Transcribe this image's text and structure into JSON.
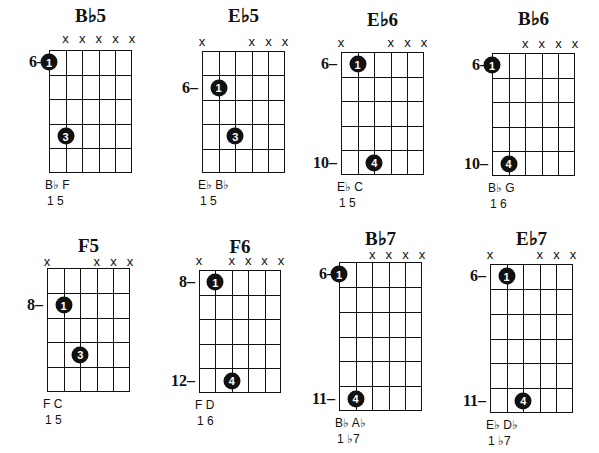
{
  "chords": [
    {
      "name": "B♭5",
      "muted_label": "x",
      "fret_labels": [
        {
          "text": "6–",
          "row": 0.5
        }
      ],
      "notes": "B♭ F",
      "degrees": "1  5",
      "rows": 5,
      "muted": [
        1,
        2,
        3,
        4,
        5
      ],
      "dots": [
        {
          "string": 0,
          "row": 0.5,
          "finger": "1"
        },
        {
          "string": 1,
          "row": 3.5,
          "finger": "3"
        }
      ]
    },
    {
      "name": "E♭5",
      "muted_label": "x",
      "fret_labels": [
        {
          "text": "6–",
          "row": 1.5
        }
      ],
      "notes": "E♭ B♭",
      "degrees": "1  5",
      "rows": 5,
      "muted": [
        0,
        3,
        4,
        5
      ],
      "dots": [
        {
          "string": 1,
          "row": 1.5,
          "finger": "1"
        },
        {
          "string": 2,
          "row": 3.5,
          "finger": "3"
        }
      ]
    },
    {
      "name": "E♭6",
      "muted_label": "x",
      "fret_labels": [
        {
          "text": "6–",
          "row": 0.5
        },
        {
          "text": "10–",
          "row": 4.5
        }
      ],
      "notes": "E♭ C",
      "degrees": "1  5",
      "rows": 5,
      "muted": [
        0,
        3,
        4,
        5
      ],
      "dots": [
        {
          "string": 1,
          "row": 0.5,
          "finger": "1"
        },
        {
          "string": 2,
          "row": 4.5,
          "finger": "4"
        }
      ]
    },
    {
      "name": "B♭6",
      "muted_label": "x",
      "fret_labels": [
        {
          "text": "6–",
          "row": 0.5
        },
        {
          "text": "10–",
          "row": 4.5
        }
      ],
      "notes": "B♭ G",
      "degrees": "1  6",
      "rows": 5,
      "muted": [
        2,
        3,
        4,
        5
      ],
      "dots": [
        {
          "string": 0,
          "row": 0.5,
          "finger": "1"
        },
        {
          "string": 1,
          "row": 4.5,
          "finger": "4"
        }
      ]
    },
    {
      "name": "F5",
      "muted_label": "x",
      "fret_labels": [
        {
          "text": "8–",
          "row": 1.5
        }
      ],
      "notes": "F C",
      "degrees": "1 5",
      "rows": 5,
      "muted": [
        0,
        3,
        4,
        5
      ],
      "dots": [
        {
          "string": 1,
          "row": 1.5,
          "finger": "1"
        },
        {
          "string": 2,
          "row": 3.5,
          "finger": "3"
        }
      ]
    },
    {
      "name": "F6",
      "muted_label": "x",
      "fret_labels": [
        {
          "text": "8–",
          "row": 0.5
        },
        {
          "text": "12–",
          "row": 4.5
        }
      ],
      "notes": "F D",
      "degrees": "1 6",
      "rows": 5,
      "muted": [
        0,
        2,
        3,
        4,
        5
      ],
      "dots": [
        {
          "string": 1,
          "row": 0.5,
          "finger": "1"
        },
        {
          "string": 2,
          "row": 4.5,
          "finger": "4"
        }
      ]
    },
    {
      "name": "B♭7",
      "muted_label": "x",
      "fret_labels": [
        {
          "text": "6–",
          "row": 0.5
        },
        {
          "text": "11–",
          "row": 5.5
        }
      ],
      "notes": "B♭ A♭",
      "degrees": "1  ♭7",
      "rows": 6,
      "muted": [
        2,
        3,
        4,
        5
      ],
      "dots": [
        {
          "string": 0,
          "row": 0.5,
          "finger": "1"
        },
        {
          "string": 1,
          "row": 5.5,
          "finger": "4"
        }
      ]
    },
    {
      "name": "E♭7",
      "muted_label": "x",
      "fret_labels": [
        {
          "text": "6–",
          "row": 0.5
        },
        {
          "text": "11–",
          "row": 5.5
        }
      ],
      "notes": "E♭ D♭",
      "degrees": "1  ♭7",
      "rows": 6,
      "muted": [
        0,
        3,
        4,
        5
      ],
      "dots": [
        {
          "string": 1,
          "row": 0.5,
          "finger": "1"
        },
        {
          "string": 2,
          "row": 5.5,
          "finger": "4"
        }
      ]
    }
  ],
  "layout": [
    {
      "gx": 49,
      "gy": 50,
      "gw": 83,
      "gh": 123,
      "ty": 6,
      "my": 32
    },
    {
      "gx": 202,
      "gy": 51,
      "gw": 83,
      "gh": 122,
      "ty": 6,
      "my": 35
    },
    {
      "gx": 341,
      "gy": 52,
      "gw": 83,
      "gh": 123,
      "ty": 10,
      "my": 36
    },
    {
      "gx": 492,
      "gy": 53,
      "gw": 83,
      "gh": 123,
      "ty": 9,
      "my": 37
    },
    {
      "gx": 47,
      "gy": 268,
      "gw": 83,
      "gh": 124,
      "ty": 236,
      "my": 255
    },
    {
      "gx": 199,
      "gy": 270,
      "gw": 82,
      "gh": 123,
      "ty": 237,
      "my": 254
    },
    {
      "gx": 339,
      "gy": 262,
      "gw": 83,
      "gh": 149,
      "ty": 229,
      "my": 248
    },
    {
      "gx": 490,
      "gy": 264,
      "gw": 83,
      "gh": 149,
      "ty": 229,
      "my": 248
    }
  ]
}
